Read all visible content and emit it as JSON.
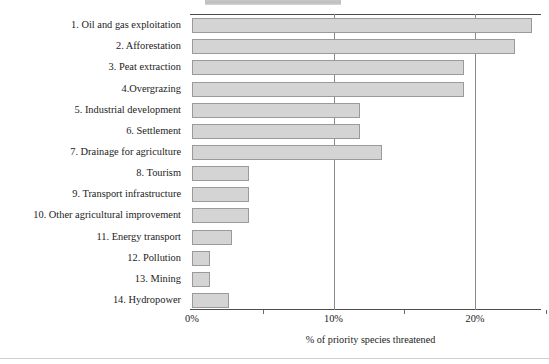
{
  "chart_data": {
    "type": "bar",
    "orientation": "horizontal",
    "title": "",
    "xlabel": "% of priority species threatened",
    "ylabel": "",
    "xlim": [
      0,
      25.2
    ],
    "xticks": [
      0,
      10,
      20
    ],
    "xtick_labels": [
      "0%",
      "10%",
      "20%"
    ],
    "xtick_minor": [
      5,
      15,
      25
    ],
    "grid": "vertical gridlines at 10% and 20%",
    "legend": "none",
    "bar_fill_color": "#d4d4d4",
    "bar_border_color": "#9a9a9a",
    "categories": [
      "1. Oil and gas exploitation",
      "2. Afforestation",
      "3. Peat extraction",
      "4.Overgrazing",
      "5. Industrial development",
      "6. Settlement",
      "7. Drainage for agriculture",
      "8. Tourism",
      "9. Transport infrastructure",
      "10. Other agricultural improvement",
      "11. Energy transport",
      "12. Pollution",
      "13. Mining",
      "14. Hydropower"
    ],
    "values": [
      24.0,
      22.8,
      19.2,
      19.2,
      11.9,
      11.9,
      13.4,
      4.0,
      4.0,
      4.0,
      2.8,
      1.3,
      1.3,
      2.6
    ]
  },
  "axis": {
    "x_title": "% of priority species threatened"
  }
}
